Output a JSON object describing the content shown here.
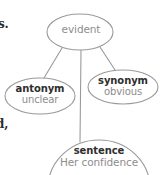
{
  "diagram": {
    "type": "word-web",
    "topic": "evident",
    "stroke_color": "#9a9a9a",
    "title_color": "#2e2e2e",
    "value_color": "#8d8d8d",
    "background": "#ffffff",
    "nodes": [
      {
        "id": "root",
        "role": "root",
        "title": "",
        "value": "evident",
        "shape": "ellipse",
        "cx": 80,
        "cy": 32,
        "rx": 33,
        "ry": 18
      },
      {
        "id": "antonym",
        "role": "branch",
        "title": "antonym",
        "value": "unclear",
        "shape": "ellipse",
        "cx": 40,
        "cy": 96,
        "rx": 35,
        "ry": 18
      },
      {
        "id": "synonym",
        "role": "branch",
        "title": "synonym",
        "value": "obvious",
        "shape": "ellipse",
        "cx": 123,
        "cy": 87,
        "rx": 35,
        "ry": 17
      },
      {
        "id": "sentence",
        "role": "branch",
        "title": "sentence",
        "value": "Her confidence",
        "shape": "ellipse",
        "cx": 99,
        "cy": 188,
        "rx": 51,
        "ry": 48
      }
    ],
    "connectors": [
      {
        "from": "root",
        "to": "antonym",
        "x1": 62,
        "y1": 48,
        "x2": 44,
        "y2": 78
      },
      {
        "from": "root",
        "to": "synonym",
        "x1": 100,
        "y1": 47,
        "x2": 115,
        "y2": 70
      },
      {
        "from": "root",
        "to": "sentence",
        "x1": 81,
        "y1": 50,
        "x2": 80,
        "y2": 142
      }
    ]
  },
  "page_fragments": [
    {
      "id": "frag-top",
      "text": "s."
    },
    {
      "id": "frag-bottom",
      "text": "d,"
    }
  ]
}
